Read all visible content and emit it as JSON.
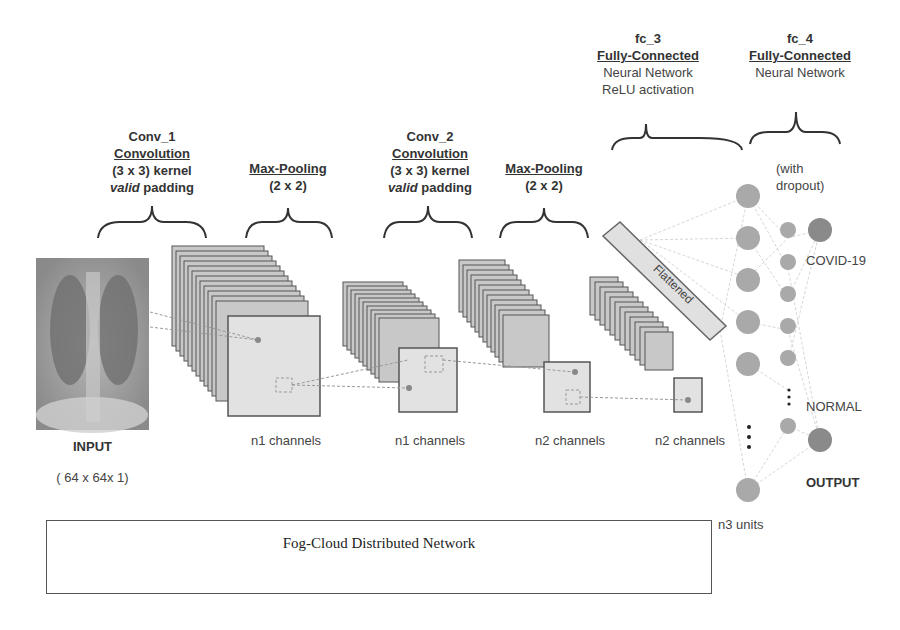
{
  "stages": {
    "conv1": {
      "name": "Conv_1",
      "type": "Convolution",
      "kernel": "(3 x 3) kernel",
      "padding_em": "valid",
      "padding": " padding"
    },
    "pool1": {
      "type": "Max-Pooling",
      "size": "(2 x 2)"
    },
    "conv2": {
      "name": "Conv_2",
      "type": "Convolution",
      "kernel": "(3 x 3) kernel",
      "padding_em": "valid",
      "padding": " padding"
    },
    "pool2": {
      "type": "Max-Pooling",
      "size": "(2 x 2)"
    },
    "fc3": {
      "name": "fc_3",
      "type": "Fully-Connected",
      "line1": "Neural Network",
      "line2": "ReLU activation"
    },
    "fc4": {
      "name": "fc_4",
      "type": "Fully-Connected",
      "line1": "Neural Network",
      "note1": "(with",
      "note2": "dropout)"
    }
  },
  "input": {
    "label": "INPUT",
    "shape": "( 64 x 64x 1)"
  },
  "channels": [
    "n1 channels",
    "n1 channels",
    "n2 channels",
    "n2 channels"
  ],
  "flattened": "Flattened",
  "units": "n3 units",
  "outputs": {
    "class1": "COVID-19",
    "class2": "NORMAL",
    "label": "OUTPUT"
  },
  "fog_box": "Fog-Cloud Distributed Network",
  "colors": {
    "node": "#a9a9a9",
    "output_node": "#8a8a8a",
    "map_fill": "#dcdcdc",
    "stroke": "#555555"
  }
}
